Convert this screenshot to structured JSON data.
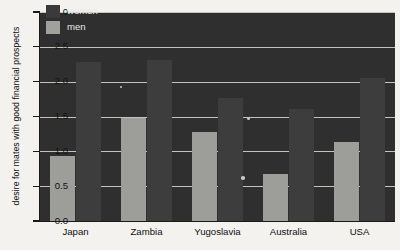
{
  "chart_data": {
    "type": "bar",
    "title": "",
    "xlabel": "",
    "ylabel": "desire for mates with good financial prospects",
    "categories": [
      "Japan",
      "Zambia",
      "Yugoslavia",
      "Australia",
      "USA"
    ],
    "series": [
      {
        "name": "women",
        "color": "#3d3d3d",
        "values": [
          2.29,
          2.31,
          1.76,
          1.61,
          2.06
        ]
      },
      {
        "name": "men",
        "color": "#9d9d9a",
        "values": [
          0.93,
          1.48,
          1.28,
          0.67,
          1.13
        ]
      }
    ],
    "ylim": [
      0.0,
      3.0
    ],
    "ytick_labels": [
      "0.0",
      "0.5",
      "1.0",
      "1.5",
      "2.0",
      "2.5",
      "3.0"
    ],
    "ytick_values": [
      0.0,
      0.5,
      1.0,
      1.5,
      2.0,
      2.5,
      3.0
    ],
    "grid": true,
    "grid_color": "#d8d8d4",
    "legend_position": "top-left",
    "plot_background": "#2f2f2f",
    "figure_background": "#f3f2ef"
  },
  "legend": {
    "entries": [
      {
        "label": "women",
        "swatch": "women"
      },
      {
        "label": "men",
        "swatch": "men"
      }
    ]
  }
}
